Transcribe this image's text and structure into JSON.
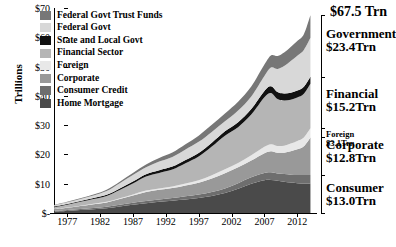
{
  "chart_data": {
    "type": "area",
    "title": "",
    "xlabel": "",
    "ylabel": "Trillions",
    "stacked": true,
    "grid": false,
    "legend_position": "top-left",
    "xlim": [
      1975,
      2015
    ],
    "ylim": [
      0,
      70
    ],
    "yticks": [
      0,
      10,
      20,
      30,
      40,
      50,
      60,
      70
    ],
    "ytick_labels": [
      "$-",
      "$10",
      "$20",
      "$30",
      "$40",
      "$50",
      "$60",
      "$70"
    ],
    "xticks": [
      1977,
      1982,
      1987,
      1992,
      1997,
      2002,
      2007,
      2012
    ],
    "xtick_labels": [
      "1977",
      "1982",
      "1987",
      "1992",
      "1997",
      "2002",
      "2007",
      "2012"
    ],
    "x": [
      1975,
      1977,
      1979,
      1981,
      1983,
      1985,
      1987,
      1989,
      1991,
      1993,
      1995,
      1997,
      1999,
      2001,
      2003,
      2005,
      2007,
      2008,
      2009,
      2010,
      2011,
      2012,
      2013,
      2014
    ],
    "series": [
      {
        "name": "Home Mortgage",
        "color": "#4a4a4a",
        "values": [
          0.5,
          0.7,
          1.0,
          1.3,
          1.6,
          2.2,
          2.8,
          3.3,
          3.8,
          4.2,
          4.6,
          5.1,
          5.8,
          6.8,
          8.3,
          10.0,
          11.2,
          11.3,
          11.0,
          10.7,
          10.4,
          10.2,
          10.1,
          10.1
        ]
      },
      {
        "name": "Consumer Credit",
        "color": "#6e6e6e",
        "values": [
          0.2,
          0.3,
          0.4,
          0.4,
          0.5,
          0.6,
          0.7,
          0.8,
          0.8,
          0.9,
          1.1,
          1.2,
          1.4,
          1.6,
          1.9,
          2.2,
          2.5,
          2.6,
          2.5,
          2.6,
          2.7,
          2.8,
          2.9,
          2.9
        ]
      },
      {
        "name": "Corporate",
        "color": "#999999",
        "values": [
          0.6,
          0.8,
          1.0,
          1.3,
          1.5,
          2.0,
          2.5,
          3.1,
          3.3,
          3.4,
          3.7,
          4.0,
          4.6,
          5.2,
          5.4,
          5.7,
          6.7,
          7.2,
          7.1,
          7.3,
          8.0,
          8.8,
          9.8,
          12.8
        ]
      },
      {
        "name": "Foreign",
        "color": "#e8e8e8",
        "values": [
          0.05,
          0.08,
          0.1,
          0.15,
          0.2,
          0.25,
          0.35,
          0.45,
          0.5,
          0.55,
          0.7,
          0.9,
          1.1,
          1.3,
          1.5,
          1.8,
          2.2,
          2.4,
          2.3,
          2.4,
          2.6,
          2.8,
          3.0,
          3.1
        ]
      },
      {
        "name": "Financial Sector",
        "color": "#b5b5b5",
        "values": [
          0.6,
          0.9,
          1.3,
          1.6,
          2.0,
          2.8,
          3.7,
          4.8,
          5.3,
          5.8,
          6.9,
          8.1,
          9.8,
          11.5,
          12.2,
          13.9,
          16.9,
          17.5,
          16.0,
          15.4,
          15.0,
          14.8,
          14.9,
          15.2
        ]
      },
      {
        "name": "State and Local Govt",
        "color": "#111111",
        "values": [
          0.22,
          0.26,
          0.3,
          0.35,
          0.42,
          0.55,
          0.7,
          0.8,
          0.9,
          1.0,
          1.1,
          1.2,
          1.3,
          1.5,
          1.7,
          1.9,
          2.2,
          2.3,
          2.4,
          2.4,
          2.4,
          2.4,
          2.4,
          2.4
        ]
      },
      {
        "name": "Federal Govt",
        "color": "#d8d8d8",
        "values": [
          0.45,
          0.6,
          0.7,
          0.9,
          1.3,
          1.8,
          2.2,
          2.4,
          3.0,
          3.3,
          3.6,
          3.8,
          3.7,
          3.4,
          4.0,
          4.3,
          5.1,
          6.4,
          7.9,
          9.4,
          10.8,
          11.9,
          12.6,
          13.3
        ]
      },
      {
        "name": "Federal Govt Trust Funds",
        "color": "#777777",
        "values": [
          0.15,
          0.2,
          0.25,
          0.3,
          0.4,
          0.5,
          0.7,
          0.9,
          1.2,
          1.5,
          1.8,
          2.1,
          2.4,
          2.7,
          3.0,
          3.4,
          3.9,
          4.1,
          4.4,
          4.6,
          4.8,
          5.0,
          5.3,
          7.7
        ]
      }
    ],
    "annotations": [
      {
        "name": "total",
        "label": "$67.5 Trn",
        "value": 67.5
      },
      {
        "name": "government",
        "label": "Government",
        "value_label": "$23.4Trn",
        "value": 23.4
      },
      {
        "name": "financial",
        "label": "Financial",
        "value_label": "$15.2Trn",
        "value": 15.2
      },
      {
        "name": "foreign",
        "label": "Foreign",
        "value_label": "$3.1Trn",
        "value": 3.1
      },
      {
        "name": "corporate",
        "label": "Corporate",
        "value_label": "$12.8Trn",
        "value": 12.8
      },
      {
        "name": "consumer",
        "label": "Consumer",
        "value_label": "$13.0Trn",
        "value": 13.0
      }
    ]
  },
  "legend": {
    "items": [
      {
        "label": "Federal Govt Trust Funds",
        "color": "#777777"
      },
      {
        "label": "Federal Govt",
        "color": "#d8d8d8"
      },
      {
        "label": "State and Local Govt",
        "color": "#111111"
      },
      {
        "label": "Financial Sector",
        "color": "#b5b5b5"
      },
      {
        "label": "Foreign",
        "color": "#e8e8e8"
      },
      {
        "label": "Corporate",
        "color": "#999999"
      },
      {
        "label": "Consumer Credit",
        "color": "#6e6e6e"
      },
      {
        "label": "Home Mortgage",
        "color": "#4a4a4a"
      }
    ]
  }
}
